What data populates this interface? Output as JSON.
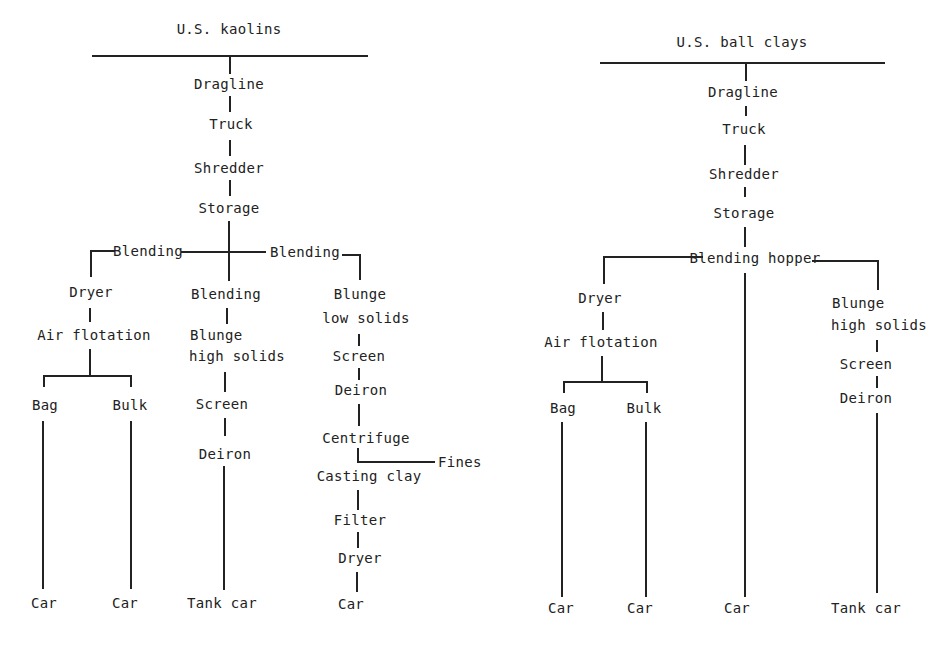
{
  "diagrams": [
    {
      "title": "U.S. kaolins",
      "trunk": [
        "Dragline",
        "Truck",
        "Shredder",
        "Storage"
      ],
      "split": {
        "left_label": "Blending",
        "right_label": "Blending"
      },
      "branches": [
        {
          "steps": [
            "Dryer",
            "Air flotation"
          ],
          "sub_branches": [
            {
              "steps": [
                "Bag"
              ],
              "end": "Car"
            },
            {
              "steps": [
                "Bulk"
              ],
              "end": "Car"
            }
          ]
        },
        {
          "steps": [
            "Blending",
            "Blunge high solids",
            "Screen",
            "Deiron"
          ],
          "end": "Tank car"
        },
        {
          "steps": [
            "Blunge low solids",
            "Screen",
            "Deiron",
            "Centrifuge",
            "Casting clay",
            "Filter",
            "Dryer"
          ],
          "side_output": "Fines",
          "end": "Car"
        }
      ]
    },
    {
      "title": "U.S. ball clays",
      "trunk": [
        "Dragline",
        "Truck",
        "Shredder",
        "Storage"
      ],
      "split": {
        "label": "Blending hopper"
      },
      "branches": [
        {
          "steps": [
            "Dryer",
            "Air flotation"
          ],
          "sub_branches": [
            {
              "steps": [
                "Bag"
              ],
              "end": "Car"
            },
            {
              "steps": [
                "Bulk"
              ],
              "end": "Car"
            }
          ]
        },
        {
          "steps": [],
          "end": "Car"
        },
        {
          "steps": [
            "Blunge high solids",
            "Screen",
            "Deiron"
          ],
          "end": "Tank car"
        }
      ]
    }
  ],
  "labels": {
    "k_title": "U.S. kaolins",
    "k_dragline": "Dragline",
    "k_truck": "Truck",
    "k_shredder": "Shredder",
    "k_storage": "Storage",
    "k_blending_left": "Blending",
    "k_blending_right": "Blending",
    "k_dryer": "Dryer",
    "k_air_flotation": "Air flotation",
    "k_bag": "Bag",
    "k_bulk": "Bulk",
    "k_car1": "Car",
    "k_car2": "Car",
    "k_blending_mid": "Blending",
    "k_blunge_high_1": "Blunge",
    "k_blunge_high_2": "high solids",
    "k_screen_mid": "Screen",
    "k_deiron_mid": "Deiron",
    "k_tank_car": "Tank car",
    "k_blunge_low_1": "Blunge",
    "k_blunge_low_2": "low solids",
    "k_screen_right": "Screen",
    "k_deiron_right": "Deiron",
    "k_centrifuge": "Centrifuge",
    "k_fines": "Fines",
    "k_casting_clay": "Casting clay",
    "k_filter": "Filter",
    "k_dryer_right": "Dryer",
    "k_car3": "Car",
    "b_title": "U.S. ball clays",
    "b_dragline": "Dragline",
    "b_truck": "Truck",
    "b_shredder": "Shredder",
    "b_storage": "Storage",
    "b_blending_hopper": "Blending hopper",
    "b_dryer": "Dryer",
    "b_air_flotation": "Air flotation",
    "b_bag": "Bag",
    "b_bulk": "Bulk",
    "b_car1": "Car",
    "b_car2": "Car",
    "b_car3": "Car",
    "b_blunge_1": "Blunge",
    "b_blunge_2": "high solids",
    "b_screen": "Screen",
    "b_deiron": "Deiron",
    "b_tank_car": "Tank car"
  }
}
